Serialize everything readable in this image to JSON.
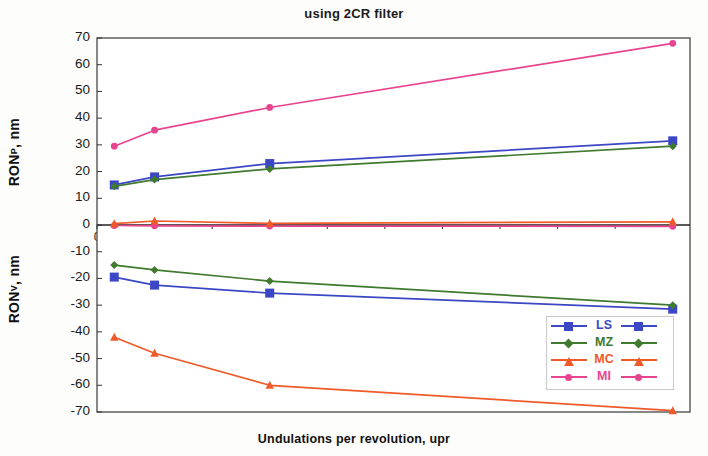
{
  "chart_data": {
    "type": "line",
    "title": "using 2CR filter",
    "xlabel": "Undulations per revolution, upr",
    "ylabel_upper": "RON",
    "ylabel_upper_sub": "P",
    "ylabel_upper_unit": ", nm",
    "ylabel_lower": "RON",
    "ylabel_lower_sub": "V",
    "ylabel_lower_unit": ", nm",
    "xlim": [
      0,
      515
    ],
    "ylim": [
      -70,
      70
    ],
    "grid": false,
    "legend_position": "inside-lower-right",
    "xticks": [
      0,
      50,
      100,
      150,
      200,
      250,
      300,
      350,
      400,
      450,
      500
    ],
    "yticks": [
      70,
      60,
      50,
      40,
      30,
      20,
      10,
      0,
      -10,
      -20,
      -30,
      -40,
      -50,
      -60,
      -70
    ],
    "x": [
      15,
      50,
      150,
      500
    ],
    "series": [
      {
        "name": "LS",
        "color": "#3b47c4",
        "marker": "square",
        "values_upper": [
          15,
          18,
          23,
          31.5
        ],
        "values_lower": [
          -19.5,
          -22.5,
          -25.5,
          -31.5
        ]
      },
      {
        "name": "MZ",
        "color": "#3f7a2e",
        "marker": "diamond",
        "values_upper": [
          14.5,
          17,
          21,
          29.5
        ],
        "values_lower": [
          -15,
          -16.8,
          -21,
          -30
        ]
      },
      {
        "name": "MC",
        "color": "#f05a28",
        "marker": "triangle",
        "values_upper": [
          0.5,
          1.5,
          0.6,
          1.2
        ],
        "values_lower": [
          -42,
          -48,
          -60,
          -69.5
        ]
      },
      {
        "name": "MI",
        "color": "#e8448f",
        "marker": "circle",
        "values_upper": [
          29.5,
          35.5,
          44,
          68
        ],
        "values_lower": [
          -0.2,
          -0.3,
          -0.4,
          -0.5
        ]
      }
    ],
    "legend": [
      {
        "label": "LS",
        "color": "#3b47c4",
        "marker": "square"
      },
      {
        "label": "MZ",
        "color": "#3f7a2e",
        "marker": "diamond"
      },
      {
        "label": "MC",
        "color": "#f05a28",
        "marker": "triangle"
      },
      {
        "label": "MI",
        "color": "#e8448f",
        "marker": "circle"
      }
    ]
  }
}
